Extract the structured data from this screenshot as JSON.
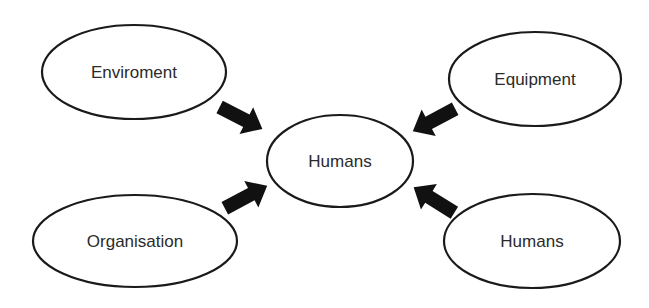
{
  "diagram": {
    "type": "hub-and-spoke",
    "colors": {
      "stroke": "#1a1a1a",
      "text": "#2b2b2b",
      "arrow": "#111111",
      "background": "#ffffff"
    },
    "center": {
      "id": "humans-center",
      "label": "Humans",
      "cx": 340,
      "cy": 161,
      "rx": 73,
      "ry": 46
    },
    "nodes": [
      {
        "id": "enviroment",
        "label": "Enviroment",
        "cx": 134,
        "cy": 72,
        "rx": 92,
        "ry": 47
      },
      {
        "id": "equipment",
        "label": "Equipment",
        "cx": 535,
        "cy": 79,
        "rx": 86,
        "ry": 47
      },
      {
        "id": "organisation",
        "label": "Organisation",
        "cx": 135,
        "cy": 241,
        "rx": 102,
        "ry": 46
      },
      {
        "id": "humans-outer",
        "label": "Humans",
        "cx": 532,
        "cy": 241,
        "rx": 88,
        "ry": 47
      }
    ],
    "edges": [
      {
        "from": "enviroment",
        "to": "humans-center",
        "x": 241,
        "y": 118,
        "angle": 27
      },
      {
        "from": "equipment",
        "to": "humans-center",
        "x": 434,
        "y": 120,
        "angle": 152
      },
      {
        "from": "organisation",
        "to": "humans-center",
        "x": 246,
        "y": 197,
        "angle": -28
      },
      {
        "from": "humans-outer",
        "to": "humans-center",
        "x": 434,
        "y": 200,
        "angle": -148
      }
    ]
  }
}
